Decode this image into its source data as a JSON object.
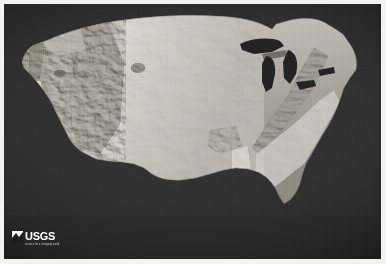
{
  "figure": {
    "kind": "shaded-relief-map",
    "border_color": "#f2f2f0",
    "ocean_color": "#2b2b2b",
    "land_light_color": "#d8d6d0",
    "land_mid_color": "#9a968e",
    "land_shadow_color": "#4a4845",
    "lake_color": "#232323"
  },
  "credit": {
    "agency_mark": "usgs-wave-mark-icon",
    "wordmark": "USGS",
    "tagline": "science for a changing world"
  },
  "map_features": {
    "water_bodies": [
      "Lake Superior",
      "Lake Michigan",
      "Lake Huron",
      "Lake Erie",
      "Lake Ontario",
      "Great Salt Lake"
    ],
    "landforms": [
      "Rocky Mountains",
      "Sierra Nevada",
      "Cascade Range",
      "Central Valley",
      "Colorado Plateau",
      "Great Plains",
      "Appalachian Mountains",
      "Ozark Plateau",
      "Mississippi Embayment",
      "Florida Peninsula",
      "Gulf Coastal Plain",
      "Atlantic Coastal Plain"
    ]
  }
}
